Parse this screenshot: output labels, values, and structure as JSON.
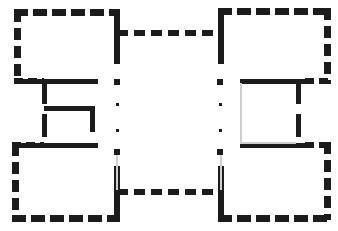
{
  "document": {
    "type": "architectural-floor-plan",
    "title": "Floor Plan",
    "description": "Symmetrical H-shaped building plan with four corner wings joined by an upper and a lower connecting corridor, with a central open courtyard marked by pier dots.",
    "canvas": {
      "width": 338,
      "height": 231
    },
    "colors": {
      "background": "#ffffff",
      "wall": "#1c1c1c",
      "wall_gap": "#ffffff",
      "light_wall": "#cfcfcf"
    },
    "wall_style": {
      "name": "hatched-masonry",
      "stroke": "#1c1c1c",
      "thick_width": 7,
      "medium_width": 5,
      "thin_width": 2,
      "dash_long": "13 4",
      "dash_medium": "9 4",
      "dash_short": "6 4"
    }
  },
  "plan": {
    "wings": [
      {
        "name": "northwest-wing",
        "label": "NW Wing",
        "x": 14,
        "y": 10,
        "width": 106,
        "height": 72
      },
      {
        "name": "northeast-wing",
        "label": "NE Wing",
        "x": 218,
        "y": 8,
        "width": 112,
        "height": 74
      },
      {
        "name": "southwest-wing",
        "label": "SW Wing",
        "x": 12,
        "y": 144,
        "width": 108,
        "height": 76
      },
      {
        "name": "southeast-wing",
        "label": "SE Wing",
        "x": 218,
        "y": 144,
        "width": 112,
        "height": 76
      }
    ],
    "corridors": [
      {
        "name": "north-corridor",
        "label": "North Connecting Corridor",
        "x1": 120,
        "x2": 218,
        "y": 33
      },
      {
        "name": "south-corridor",
        "label": "South Connecting Corridor",
        "x1": 120,
        "x2": 218,
        "y": 192
      }
    ],
    "courtyard": {
      "name": "central-courtyard",
      "label": "Central Courtyard",
      "x": 120,
      "y": 40,
      "width": 98,
      "height": 150
    },
    "pier_markers": {
      "label": "Pier / Column Markers",
      "left_column_x": 117,
      "right_column_x": 220,
      "rows": [
        {
          "y": 82,
          "size": 6,
          "shape": "square"
        },
        {
          "y": 104,
          "size": 3,
          "shape": "dot"
        },
        {
          "y": 130,
          "size": 3,
          "shape": "dot"
        },
        {
          "y": 152,
          "size": 6,
          "shape": "square"
        }
      ]
    },
    "interior_partitions": [
      {
        "name": "nw-wing-lower-partition",
        "label": "NW wing lower cross wall",
        "type": "horizontal",
        "x1": 18,
        "x2": 98,
        "y": 81
      },
      {
        "name": "nw-wing-stub-wall",
        "label": "NW wing vertical stub",
        "type": "vertical",
        "x": 44,
        "y1": 81,
        "y2": 145
      },
      {
        "name": "inner-room-top-wall",
        "label": "Inner room top wall",
        "type": "horizontal",
        "x1": 44,
        "x2": 94,
        "y": 108
      },
      {
        "name": "inner-room-right-wall",
        "label": "Inner room right wall",
        "type": "vertical",
        "x": 92,
        "y1": 108,
        "y2": 131
      },
      {
        "name": "sw-wing-upper-partition",
        "label": "SW wing upper cross wall",
        "type": "horizontal",
        "x1": 18,
        "x2": 98,
        "y": 145
      },
      {
        "name": "ne-inner-room-top-wall",
        "label": "NE inner room top wall",
        "type": "horizontal",
        "x1": 240,
        "x2": 310,
        "y": 81
      },
      {
        "name": "ne-inner-room-right-wall",
        "label": "NE inner room right wall",
        "type": "vertical",
        "x": 298,
        "y1": 81,
        "y2": 145
      },
      {
        "name": "se-inner-room-bottom-wall",
        "label": "SE inner room bottom wall",
        "type": "horizontal",
        "x1": 240,
        "x2": 310,
        "y": 145
      },
      {
        "name": "ne-inner-room-left-wall",
        "label": "NE inner room light left wall",
        "type": "vertical-light",
        "x": 241,
        "y1": 83,
        "y2": 144
      }
    ]
  }
}
